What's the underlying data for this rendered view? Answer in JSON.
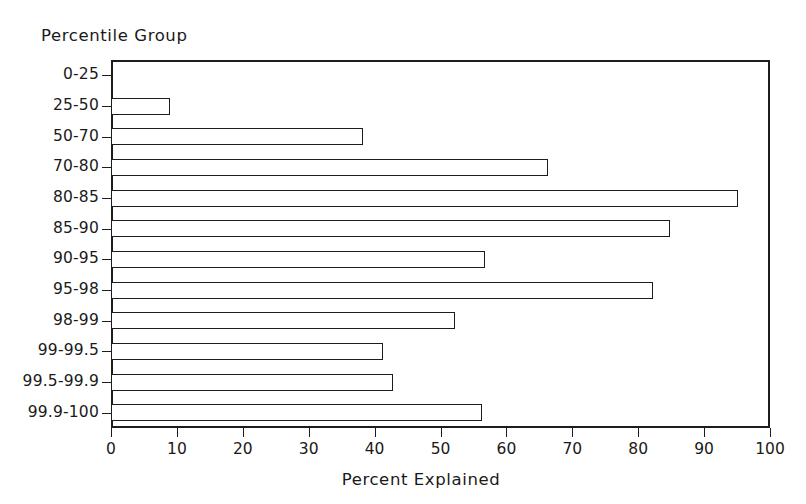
{
  "chart_data": {
    "type": "bar",
    "orientation": "horizontal",
    "title": "",
    "ylabel": "Percentile Group",
    "xlabel": "Percent Explained",
    "xlim": [
      0,
      100
    ],
    "xticks": [
      0,
      10,
      20,
      30,
      40,
      50,
      60,
      70,
      80,
      90,
      100
    ],
    "xtick_labels": [
      "0",
      "10",
      "20",
      "30",
      "40",
      "50",
      "60",
      "70",
      "80",
      "90",
      "100"
    ],
    "grid": false,
    "legend": false,
    "categories": [
      "0-25",
      "25-50",
      "50-70",
      "70-80",
      "80-85",
      "85-90",
      "90-95",
      "95-98",
      "98-99",
      "99-99.5",
      "99.5-99.9",
      "99.9-100"
    ],
    "values": [
      0,
      8.9,
      38.2,
      66.3,
      95.2,
      84.8,
      56.8,
      82.2,
      52.2,
      41.3,
      42.8,
      56.3
    ],
    "bar_style": {
      "fill": "#ffffff",
      "edge": "#1d1d1d"
    }
  },
  "axes": {
    "y_title": "Percentile Group",
    "x_title": "Percent Explained"
  },
  "colors": {
    "ink": "#1d1d1d",
    "background": "#ffffff"
  }
}
